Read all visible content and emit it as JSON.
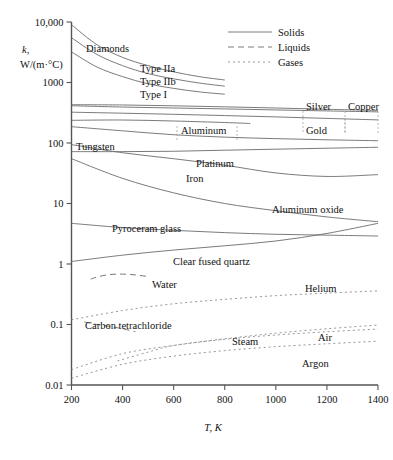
{
  "chart_data": {
    "type": "line",
    "title": "",
    "xlabel": "T, K",
    "ylabel": "k, W/(m·°C)",
    "ylabel_symbol": "k,",
    "ylabel_units": "W/(m·°C)",
    "xlim": [
      200,
      1400
    ],
    "ylim": [
      0.01,
      10000
    ],
    "yscale": "log",
    "xscale": "linear",
    "grid": false,
    "xticks": [
      "200",
      "400",
      "600",
      "800",
      "1000",
      "1200",
      "1400"
    ],
    "xtick_values": [
      200,
      400,
      600,
      800,
      1000,
      1200,
      1400
    ],
    "yticks": [
      "10,000",
      "1000",
      "100",
      "10",
      "1",
      "0.1",
      "0.01"
    ],
    "ytick_values": [
      10000,
      1000,
      100,
      10,
      1,
      0.1,
      0.01
    ],
    "legend": {
      "position": "top-right",
      "entries": [
        {
          "label": "Solids",
          "style": "solid"
        },
        {
          "label": "Liquids",
          "style": "dashed"
        },
        {
          "label": "Gases",
          "style": "dotted"
        }
      ]
    },
    "group_label_diamonds": "Diamonds",
    "series": [
      {
        "name": "Type IIa",
        "style": "solid",
        "label": "Type IIa",
        "x": [
          200,
          300,
          400,
          500,
          600,
          700,
          800
        ],
        "values": [
          9000,
          4200,
          2600,
          1900,
          1500,
          1250,
          1100
        ]
      },
      {
        "name": "Type IIb",
        "style": "solid",
        "label": "Type IIb",
        "x": [
          200,
          300,
          400,
          500,
          600,
          700,
          800
        ],
        "values": [
          5500,
          2900,
          1900,
          1400,
          1150,
          980,
          870
        ]
      },
      {
        "name": "Type I",
        "style": "solid",
        "label": "Type I",
        "x": [
          200,
          300,
          400,
          500,
          600,
          700,
          800
        ],
        "values": [
          3200,
          1800,
          1250,
          950,
          800,
          700,
          640
        ]
      },
      {
        "name": "Silver",
        "style": "solid",
        "label": "Silver",
        "x": [
          200,
          400,
          600,
          800,
          1000,
          1200,
          1400
        ],
        "values": [
          430,
          425,
          412,
          396,
          379,
          361,
          345
        ]
      },
      {
        "name": "Copper",
        "style": "solid",
        "label": "Copper",
        "x": [
          200,
          400,
          600,
          800,
          1000,
          1200,
          1400
        ],
        "values": [
          413,
          393,
          379,
          366,
          352,
          339,
          327
        ]
      },
      {
        "name": "Gold",
        "style": "solid",
        "label": "Gold",
        "x": [
          200,
          400,
          600,
          800,
          1000,
          1200,
          1400
        ],
        "values": [
          323,
          311,
          298,
          284,
          270,
          255,
          241
        ]
      },
      {
        "name": "Aluminum",
        "style": "solid",
        "label": "Aluminum",
        "x": [
          200,
          400,
          600,
          800,
          900
        ],
        "values": [
          237,
          240,
          231,
          218,
          210
        ]
      },
      {
        "name": "Tungsten",
        "style": "solid",
        "label": "Tungsten",
        "x": [
          200,
          400,
          600,
          800,
          1000,
          1200,
          1400
        ],
        "values": [
          186,
          159,
          137,
          125,
          118,
          113,
          109
        ]
      },
      {
        "name": "Platinum",
        "style": "solid",
        "label": "Platinum",
        "x": [
          200,
          400,
          600,
          800,
          1000,
          1200,
          1400
        ],
        "values": [
          72,
          72,
          73,
          76,
          79,
          82,
          85
        ]
      },
      {
        "name": "Iron",
        "style": "solid",
        "label": "Iron",
        "x": [
          200,
          400,
          600,
          800,
          1000,
          1200,
          1400
        ],
        "values": [
          94,
          69,
          55,
          43,
          32,
          28,
          30
        ]
      },
      {
        "name": "Aluminum oxide",
        "style": "solid",
        "label": "Aluminum oxide",
        "x": [
          200,
          400,
          600,
          800,
          1000,
          1200,
          1400
        ],
        "values": [
          55,
          26,
          15,
          10,
          7.6,
          6.0,
          5.0
        ]
      },
      {
        "name": "Pyroceram glass",
        "style": "solid",
        "label": "Pyroceram glass",
        "x": [
          200,
          400,
          600,
          800,
          1000,
          1200,
          1400
        ],
        "values": [
          4.7,
          4.0,
          3.6,
          3.3,
          3.1,
          3.0,
          2.9
        ]
      },
      {
        "name": "Clear fused quartz",
        "style": "solid",
        "label": "Clear fused quartz",
        "x": [
          200,
          400,
          600,
          800,
          1000,
          1200,
          1400
        ],
        "values": [
          1.1,
          1.4,
          1.7,
          2.0,
          2.4,
          3.2,
          4.7
        ]
      },
      {
        "name": "Water",
        "style": "dashed",
        "label": "Water",
        "x": [
          275,
          300,
          350,
          400,
          450,
          500
        ],
        "values": [
          0.56,
          0.61,
          0.67,
          0.68,
          0.66,
          0.62
        ]
      },
      {
        "name": "Carbon tetrachloride",
        "style": "dashed",
        "label": "Carbon tetrachloride",
        "x": [
          250,
          300,
          350,
          400,
          450
        ],
        "values": [
          0.11,
          0.1,
          0.093,
          0.085,
          0.076
        ]
      },
      {
        "name": "Helium",
        "style": "dotted",
        "label": "Helium",
        "x": [
          200,
          400,
          600,
          800,
          1000,
          1200,
          1400
        ],
        "values": [
          0.12,
          0.17,
          0.22,
          0.26,
          0.3,
          0.33,
          0.36
        ]
      },
      {
        "name": "Steam",
        "style": "dotted",
        "label": "Steam",
        "x": [
          380,
          500,
          600,
          800,
          1000,
          1200,
          1400
        ],
        "values": [
          0.025,
          0.035,
          0.045,
          0.058,
          0.072,
          0.085,
          0.098
        ]
      },
      {
        "name": "Air",
        "style": "dotted",
        "label": "Air",
        "x": [
          200,
          400,
          600,
          800,
          1000,
          1200,
          1400
        ],
        "values": [
          0.018,
          0.033,
          0.045,
          0.057,
          0.067,
          0.076,
          0.084
        ]
      },
      {
        "name": "Argon",
        "style": "dotted",
        "label": "Argon",
        "x": [
          200,
          400,
          600,
          800,
          1000,
          1200,
          1400
        ],
        "values": [
          0.013,
          0.022,
          0.03,
          0.037,
          0.043,
          0.048,
          0.053
        ]
      }
    ]
  }
}
